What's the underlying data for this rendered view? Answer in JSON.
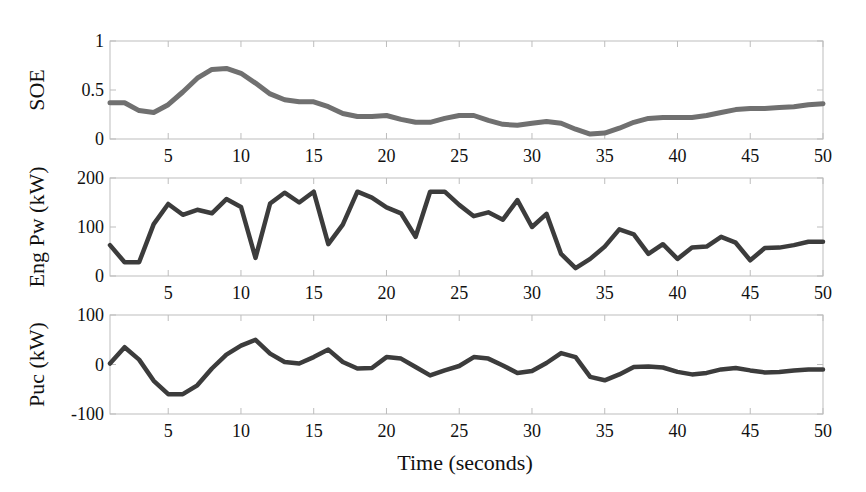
{
  "chart_data": [
    {
      "type": "line",
      "panel": "top",
      "title": "",
      "xlabel": "",
      "ylabel": "SOE",
      "xlim": [
        1,
        50
      ],
      "ylim": [
        0,
        1
      ],
      "yticks": [
        0,
        0.5,
        1
      ],
      "ytick_labels": [
        "0",
        "0.5",
        "1"
      ],
      "xticks": [
        5,
        10,
        15,
        20,
        25,
        30,
        35,
        40,
        45,
        50
      ],
      "xtick_labels": [
        "5",
        "10",
        "15",
        "20",
        "25",
        "30",
        "35",
        "40",
        "45",
        "50"
      ],
      "grid": false,
      "line_color": "#707070",
      "series": [
        {
          "name": "SOE",
          "x": [
            1,
            2,
            3,
            4,
            5,
            6,
            7,
            8,
            9,
            10,
            11,
            12,
            13,
            14,
            15,
            16,
            17,
            18,
            19,
            20,
            21,
            22,
            23,
            24,
            25,
            26,
            27,
            28,
            29,
            30,
            31,
            32,
            33,
            34,
            35,
            36,
            37,
            38,
            39,
            40,
            41,
            42,
            43,
            44,
            45,
            46,
            47,
            48,
            49,
            50
          ],
          "values": [
            0.37,
            0.37,
            0.29,
            0.27,
            0.35,
            0.48,
            0.62,
            0.71,
            0.72,
            0.67,
            0.57,
            0.46,
            0.4,
            0.38,
            0.38,
            0.33,
            0.26,
            0.23,
            0.23,
            0.24,
            0.2,
            0.17,
            0.17,
            0.21,
            0.24,
            0.24,
            0.19,
            0.15,
            0.14,
            0.16,
            0.18,
            0.16,
            0.1,
            0.05,
            0.06,
            0.11,
            0.17,
            0.21,
            0.22,
            0.22,
            0.22,
            0.24,
            0.27,
            0.3,
            0.31,
            0.31,
            0.32,
            0.33,
            0.35,
            0.36
          ]
        }
      ]
    },
    {
      "type": "line",
      "panel": "middle",
      "title": "",
      "xlabel": "",
      "ylabel": "Eng Pw (kW)",
      "xlim": [
        1,
        50
      ],
      "ylim": [
        0,
        200
      ],
      "yticks": [
        0,
        100,
        200
      ],
      "ytick_labels": [
        "0",
        "100",
        "200"
      ],
      "xticks": [
        5,
        10,
        15,
        20,
        25,
        30,
        35,
        40,
        45,
        50
      ],
      "xtick_labels": [
        "5",
        "10",
        "15",
        "20",
        "25",
        "30",
        "35",
        "40",
        "45",
        "50"
      ],
      "grid": false,
      "line_color": "#3c3c3c",
      "series": [
        {
          "name": "Eng Pw",
          "x": [
            1,
            2,
            3,
            4,
            5,
            6,
            7,
            8,
            9,
            10,
            11,
            12,
            13,
            14,
            15,
            16,
            17,
            18,
            19,
            20,
            21,
            22,
            23,
            24,
            25,
            26,
            27,
            28,
            29,
            30,
            31,
            32,
            33,
            34,
            35,
            36,
            37,
            38,
            39,
            40,
            41,
            42,
            43,
            44,
            45,
            46,
            47,
            48,
            49,
            50
          ],
          "values": [
            63,
            28,
            28,
            106,
            147,
            125,
            135,
            128,
            157,
            141,
            37,
            148,
            170,
            150,
            172,
            65,
            105,
            172,
            160,
            140,
            128,
            80,
            172,
            172,
            145,
            122,
            130,
            115,
            155,
            100,
            127,
            45,
            16,
            35,
            60,
            95,
            85,
            45,
            65,
            35,
            58,
            60,
            80,
            68,
            32,
            57,
            58,
            63,
            70,
            70
          ]
        }
      ]
    },
    {
      "type": "line",
      "panel": "bottom",
      "title": "",
      "xlabel": "Time (seconds)",
      "ylabel": "Puc (kW)",
      "xlim": [
        1,
        50
      ],
      "ylim": [
        -100,
        100
      ],
      "yticks": [
        -100,
        0,
        100
      ],
      "ytick_labels": [
        "-100",
        "0",
        "100"
      ],
      "xticks": [
        5,
        10,
        15,
        20,
        25,
        30,
        35,
        40,
        45,
        50
      ],
      "xtick_labels": [
        "5",
        "10",
        "15",
        "20",
        "25",
        "30",
        "35",
        "40",
        "45",
        "50"
      ],
      "grid": false,
      "line_color": "#3c3c3c",
      "series": [
        {
          "name": "Puc",
          "x": [
            1,
            2,
            3,
            4,
            5,
            6,
            7,
            8,
            9,
            10,
            11,
            12,
            13,
            14,
            15,
            16,
            17,
            18,
            19,
            20,
            21,
            22,
            23,
            24,
            25,
            26,
            27,
            28,
            29,
            30,
            31,
            32,
            33,
            34,
            35,
            36,
            37,
            38,
            39,
            40,
            41,
            42,
            43,
            44,
            45,
            46,
            47,
            48,
            49,
            50
          ],
          "values": [
            2,
            35,
            10,
            -33,
            -60,
            -60,
            -42,
            -8,
            20,
            38,
            50,
            22,
            5,
            2,
            15,
            30,
            5,
            -8,
            -7,
            15,
            12,
            -5,
            -22,
            -12,
            -3,
            15,
            12,
            -2,
            -17,
            -13,
            3,
            23,
            15,
            -25,
            -32,
            -20,
            -5,
            -4,
            -6,
            -15,
            -20,
            -17,
            -10,
            -7,
            -12,
            -16,
            -15,
            -12,
            -10,
            -10
          ]
        }
      ]
    }
  ],
  "labels": {
    "soe_ylabel": "SOE",
    "eng_ylabel": "Eng Pw (kW)",
    "puc_ylabel": "Puc (kW)",
    "xlabel": "Time (seconds)"
  }
}
